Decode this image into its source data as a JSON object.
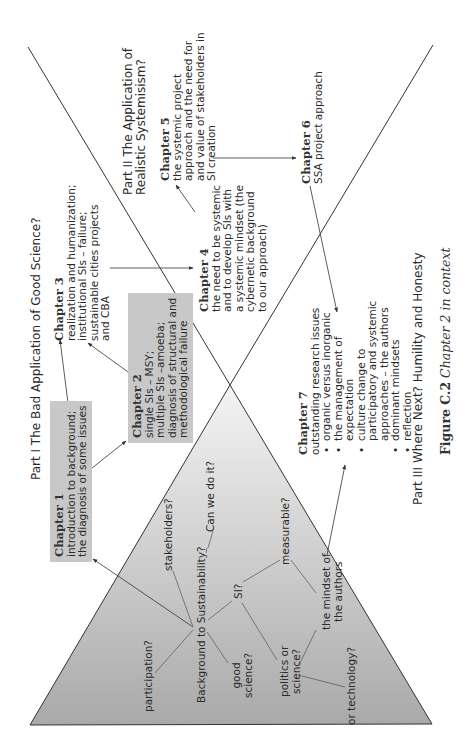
{
  "figure": {
    "caption_label": "Figure C.2",
    "caption_text": "Chapter 2 in context"
  },
  "parts": {
    "part1": "Part I The Bad Application of Good Science?",
    "part2_line1": "Part II The Application of",
    "part2_line2": "Realistic Systemisism?",
    "part3": "Part III Where Next? Humility and Honesty"
  },
  "chapters": {
    "ch1": {
      "title": "Chapter 1",
      "lines": [
        "introduction to background;",
        "the diagnosis of some issues"
      ],
      "shaded": true
    },
    "ch2": {
      "title": "Chapter 2",
      "lines": [
        "single SIs – MSY;",
        "multiple SIs –amoeba;",
        "diagnosis of structural and",
        "methodological failure"
      ],
      "shaded": true
    },
    "ch3": {
      "title": "Chapter 3",
      "lines": [
        "realization and humanization;",
        "institutional SIs – failure;",
        "sustainable cities projects",
        "and CBA"
      ],
      "shaded": false
    },
    "ch4": {
      "title": "Chapter 4",
      "lines": [
        "the need to be systemic",
        "and to develop SIs with",
        "a systemic mindset (the",
        "cybernetic background",
        "to our approach)"
      ],
      "shaded": false
    },
    "ch5": {
      "title": "Chapter 5",
      "lines": [
        "the systemic project",
        "approach and the need for",
        "and value of stakeholders in",
        "SI creation"
      ],
      "shaded": false
    },
    "ch6": {
      "title": "Chapter 6",
      "lines": [
        "SSA project approach"
      ],
      "shaded": false
    },
    "ch7": {
      "title": "Chapter 7",
      "intro": "outstanding research issues",
      "bullets": [
        "organic versus inorganic",
        "the management of expectation",
        "culture change to participatory and systemic approaches – the authors",
        "dominant mindsets",
        "reflection"
      ],
      "bullet_lines": [
        [
          "organic versus inorganic"
        ],
        [
          "the management of",
          "expectation"
        ],
        [
          "culture change to",
          "participatory and systemic",
          "approaches – the authors"
        ],
        [
          "dominant mindsets"
        ],
        [
          "reflection"
        ]
      ]
    }
  },
  "mindmap": {
    "center": "Background to Sustainability?",
    "nodes": {
      "participation": "participation?",
      "stakeholders": "stakeholders?",
      "can_we_do_it": "Can we do it?",
      "good_science_1": "good",
      "good_science_2": "science?",
      "si": "SI?",
      "measurable": "measurable?",
      "politics_1": "politics or",
      "politics_2": "science?",
      "mindset_1": "the mindset of",
      "mindset_2": "the authors",
      "technology": "or technology?"
    }
  },
  "colors": {
    "triangle_light": "#f4f4f4",
    "triangle_dark": "#a9a9a9",
    "box_fill": "#c8c8c8",
    "line": "#333333"
  }
}
